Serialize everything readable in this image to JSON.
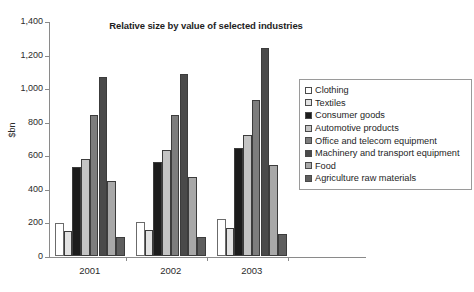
{
  "chart_data": {
    "type": "bar",
    "title": "Relative size by value of selected industries",
    "xlabel": "",
    "ylabel": "$bn",
    "ylim": [
      0,
      1400
    ],
    "yticks": [
      "0",
      "200",
      "400",
      "600",
      "800",
      "1,000",
      "1,200",
      "1,400"
    ],
    "ytick_values": [
      0,
      200,
      400,
      600,
      800,
      1000,
      1200,
      1400
    ],
    "grid": false,
    "legend_position": "right",
    "categories": [
      "2001",
      "2002",
      "2003"
    ],
    "series": [
      {
        "name": "Clothing",
        "color": "#ffffff",
        "values": [
          198,
          203,
          222
        ]
      },
      {
        "name": "Textiles",
        "color": "#e2e2e2",
        "values": [
          148,
          155,
          166
        ]
      },
      {
        "name": "Consumer goods",
        "color": "#1c1c1c",
        "values": [
          533,
          561,
          643
        ]
      },
      {
        "name": "Automotive products",
        "color": "#c4c4c4",
        "values": [
          577,
          629,
          722
        ]
      },
      {
        "name": "Office and telecom equipment",
        "color": "#7d7d7d",
        "values": [
          840,
          843,
          929
        ]
      },
      {
        "name": "Machinery and transport equipment",
        "color": "#4a4a4a",
        "values": [
          1068,
          1085,
          1240
        ]
      },
      {
        "name": "Food",
        "color": "#a8a8a8",
        "values": [
          449,
          470,
          543
        ]
      },
      {
        "name": "Agriculture raw materials",
        "color": "#5e5e5e",
        "values": [
          112,
          112,
          129
        ]
      }
    ]
  },
  "legend": {
    "items": [
      "Clothing",
      "Textiles",
      "Consumer goods",
      "Automotive products",
      "Office and telecom equipment",
      "Machinery and transport equipment",
      "Food",
      "Agriculture raw materials"
    ]
  },
  "colors": {
    "axis": "#8a8a8a",
    "text": "#2b2b2b",
    "legend_border": "#9a9a9a",
    "background": "#ffffff"
  }
}
